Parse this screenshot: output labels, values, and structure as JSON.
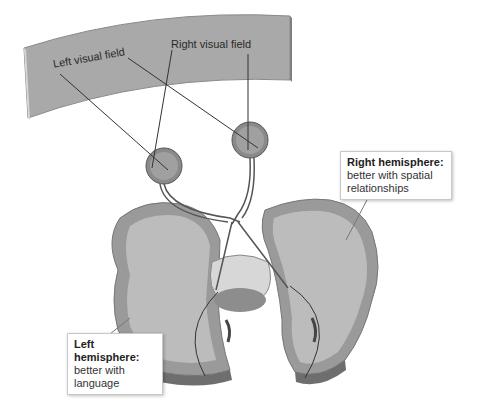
{
  "diagram": {
    "type": "anatomical-illustration",
    "labels": {
      "left_visual_field": "Left visual field",
      "right_visual_field": "Right visual field"
    },
    "callouts": {
      "right_hemisphere": {
        "title": "Right hemisphere:",
        "line1": "better with spatial",
        "line2": "relationships"
      },
      "left_hemisphere": {
        "title": "Left hemisphere:",
        "line1": "better with",
        "line2": "language"
      }
    },
    "colors": {
      "screen": "#a8a8a8",
      "brain_outer": "#9a9a9a",
      "brain_inner": "#bdbdbd",
      "lines": "#333333"
    }
  }
}
